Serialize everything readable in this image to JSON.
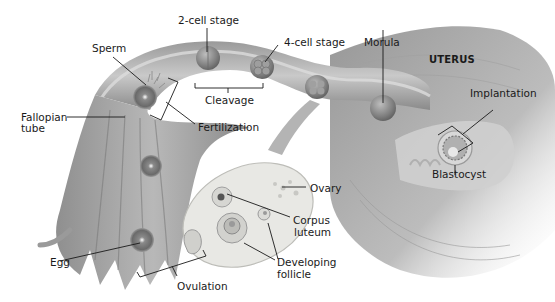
{
  "diagram": {
    "colors": {
      "background": "#ffffff",
      "tissue_dark": "#7a7a7a",
      "tissue_mid": "#a8a8a8",
      "tissue_light": "#d4d4d4",
      "ovary_fill": "#e8e8e4",
      "leader_line": "#1a1a1a"
    },
    "labels": {
      "two_cell_stage": "2-cell stage",
      "four_cell_stage": "4-cell stage",
      "morula": "Morula",
      "uterus": "UTERUS",
      "sperm": "Sperm",
      "fallopian_tube_line1": "Fallopian",
      "fallopian_tube_line2": "tube",
      "cleavage": "Cleavage",
      "fertilization": "Fertilization",
      "implantation": "Implantation",
      "blastocyst": "Blastocyst",
      "ovary": "Ovary",
      "corpus_luteum_line1": "Corpus",
      "corpus_luteum_line2": "luteum",
      "developing_follicle_line1": "Developing",
      "developing_follicle_line2": "follicle",
      "egg": "Egg",
      "ovulation": "Ovulation"
    }
  }
}
